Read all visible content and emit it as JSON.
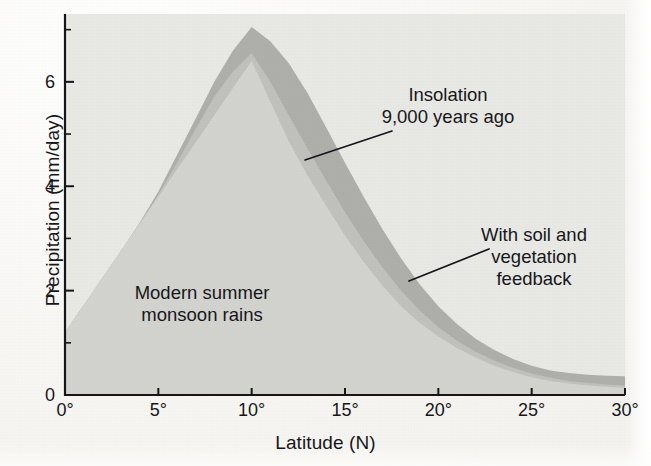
{
  "chart_data": {
    "type": "area",
    "title": "",
    "xlabel": "Latitude (N)",
    "ylabel": "Precipitation (mm/day)",
    "xlim": [
      0,
      30
    ],
    "ylim": [
      0,
      7.3
    ],
    "grid": false,
    "legend": "annotations",
    "xticks": [
      "0°",
      "5°",
      "10°",
      "15°",
      "20°",
      "25°",
      "30°"
    ],
    "xtick_values": [
      0,
      5,
      10,
      15,
      20,
      25,
      30
    ],
    "yticks": [
      "0",
      "2",
      "4",
      "6"
    ],
    "ytick_values": [
      0,
      2,
      4,
      6
    ],
    "yminor_values": [
      1,
      3,
      5,
      7
    ],
    "x": [
      0,
      1,
      2,
      3,
      4,
      5,
      6,
      7,
      8,
      9,
      10,
      11,
      12,
      13,
      14,
      15,
      16,
      17,
      18,
      19,
      20,
      21,
      22,
      23,
      24,
      25,
      26,
      27,
      28,
      29,
      30
    ],
    "series": [
      {
        "name": "Modern summer monsoon rains",
        "color": "#d2d2cf",
        "values": [
          1.2,
          1.72,
          2.24,
          2.76,
          3.28,
          3.8,
          4.32,
          4.84,
          5.36,
          5.88,
          6.4,
          5.62,
          4.85,
          4.2,
          3.62,
          3.05,
          2.55,
          2.1,
          1.7,
          1.38,
          1.12,
          0.9,
          0.72,
          0.56,
          0.44,
          0.34,
          0.27,
          0.22,
          0.18,
          0.16,
          0.14
        ]
      },
      {
        "name": "With soil and vegetation feedback",
        "color": "#c0c0bd",
        "values": [
          1.2,
          1.72,
          2.24,
          2.76,
          3.28,
          3.84,
          4.45,
          5.1,
          5.72,
          6.2,
          6.55,
          6.0,
          5.35,
          4.72,
          4.1,
          3.5,
          2.95,
          2.45,
          2.0,
          1.62,
          1.3,
          1.04,
          0.83,
          0.66,
          0.52,
          0.41,
          0.33,
          0.27,
          0.23,
          0.2,
          0.18
        ]
      },
      {
        "name": "Insolation 9,000 years ago",
        "color": "#aeaeab",
        "values": [
          1.2,
          1.72,
          2.24,
          2.76,
          3.3,
          3.9,
          4.6,
          5.3,
          6.0,
          6.6,
          7.05,
          6.78,
          6.35,
          5.78,
          5.12,
          4.45,
          3.8,
          3.18,
          2.62,
          2.12,
          1.7,
          1.36,
          1.08,
          0.86,
          0.69,
          0.56,
          0.47,
          0.42,
          0.39,
          0.37,
          0.36
        ]
      }
    ],
    "annotations": [
      {
        "id": "insolation",
        "text_lines": [
          "Insolation",
          "9,000 years ago"
        ],
        "text_x": 448,
        "text_y": 84,
        "leader": {
          "x1": 392,
          "y1": 131,
          "x2": 305,
          "y2": 160
        }
      },
      {
        "id": "feedback",
        "text_lines": [
          "With soil and",
          "vegetation",
          "feedback"
        ],
        "text_x": 534,
        "text_y": 224,
        "leader": {
          "x1": 489,
          "y1": 249,
          "x2": 409,
          "y2": 281
        }
      },
      {
        "id": "modern",
        "text_lines": [
          "Modern summer",
          "monsoon rains"
        ],
        "text_x": 202,
        "text_y": 282,
        "leader": null
      }
    ],
    "geometry": {
      "plot_left": 65,
      "plot_right": 625,
      "plot_top": 14,
      "plot_bottom": 395,
      "axis_color": "#15151a",
      "panel_color": "#e8e8e5"
    }
  }
}
